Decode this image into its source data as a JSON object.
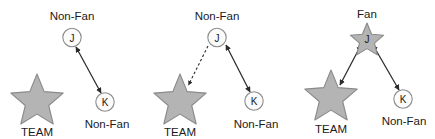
{
  "figure": {
    "title": "",
    "width": 435,
    "height": 139,
    "background": "#ffffff",
    "colors": {
      "star_fill": "#b4b4b4",
      "star_stroke": "#8a8a8a",
      "circle_fill": "#fbfbfb",
      "circle_stroke": "#8c8c8c",
      "edge": "#2b2b2b",
      "text": "#1a1a1a"
    }
  },
  "panels": [
    {
      "id": "panel-1",
      "nodes": {
        "team": {
          "letter": "",
          "caption": "TEAM",
          "shape": "star"
        },
        "j": {
          "letter": "J",
          "caption": "Non-Fan",
          "shape": "circle"
        },
        "k": {
          "letter": "K",
          "caption": "Non-Fan",
          "shape": "circle"
        }
      },
      "edges": [
        {
          "from": "j",
          "to": "k",
          "style": "solid",
          "arrows": "double"
        }
      ]
    },
    {
      "id": "panel-2",
      "nodes": {
        "team": {
          "letter": "",
          "caption": "TEAM",
          "shape": "star"
        },
        "j": {
          "letter": "J",
          "caption": "Non-Fan",
          "shape": "circle"
        },
        "k": {
          "letter": "K",
          "caption": "Non-Fan",
          "shape": "circle"
        }
      },
      "edges": [
        {
          "from": "j",
          "to": "team",
          "style": "dashed",
          "arrows": "single"
        },
        {
          "from": "j",
          "to": "k",
          "style": "solid",
          "arrows": "double"
        }
      ]
    },
    {
      "id": "panel-3",
      "nodes": {
        "team": {
          "letter": "",
          "caption": "TEAM",
          "shape": "star"
        },
        "j": {
          "letter": "J",
          "caption": "Fan",
          "shape": "star"
        },
        "k": {
          "letter": "K",
          "caption": "Non-Fan",
          "shape": "circle"
        }
      },
      "edges": [
        {
          "from": "j",
          "to": "team",
          "style": "solid",
          "arrows": "double"
        },
        {
          "from": "j",
          "to": "k",
          "style": "solid",
          "arrows": "double"
        }
      ]
    }
  ],
  "labels": {
    "p1_top": "Non-Fan",
    "p1_team": "TEAM",
    "p1_k": "Non-Fan",
    "p1_j_letter": "J",
    "p1_k_letter": "K",
    "p2_top": "Non-Fan",
    "p2_team": "TEAM",
    "p2_k": "Non-Fan",
    "p2_j_letter": "J",
    "p2_k_letter": "K",
    "p3_top": "Fan",
    "p3_team": "TEAM",
    "p3_k": "Non-Fan",
    "p3_j_letter": "J",
    "p3_k_letter": "K"
  }
}
